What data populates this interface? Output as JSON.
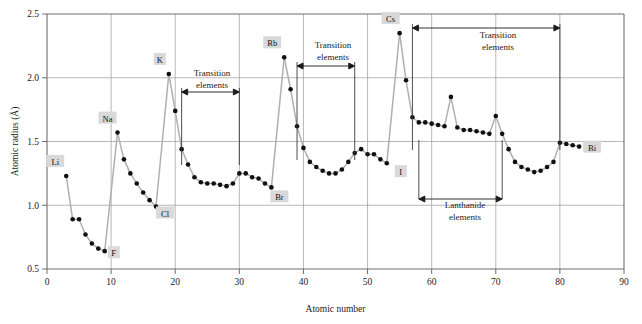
{
  "figure": {
    "background_color": "#ffffff",
    "curve_color": "#b0b0b0",
    "marker_color": "#101010",
    "grid_color": "#9a9a9a",
    "label_box_color": "#d9d9d9"
  },
  "chart_data": {
    "type": "line",
    "title": "",
    "xlabel": "Atomic number",
    "ylabel": "Atomic radius (Å)",
    "xlim": [
      0,
      90
    ],
    "ylim": [
      0.5,
      2.5
    ],
    "xticks": [
      0,
      10,
      20,
      30,
      40,
      50,
      60,
      70,
      80,
      90
    ],
    "xticklabels": [
      "0",
      "10",
      "20",
      "30",
      "40",
      "50",
      "60",
      "70",
      "80",
      "90"
    ],
    "yticks": [
      0.5,
      1.0,
      1.5,
      2.0,
      2.5
    ],
    "yticklabels": [
      "0.5",
      "1.0",
      "1.5",
      "2.0",
      "2.5"
    ],
    "grid": "major vertical every 10, major horizontal every 0.5",
    "legend": "none",
    "x": [
      3,
      4,
      5,
      6,
      7,
      8,
      9,
      11,
      12,
      13,
      14,
      15,
      16,
      17,
      19,
      20,
      21,
      22,
      23,
      24,
      25,
      26,
      27,
      28,
      29,
      30,
      31,
      32,
      33,
      34,
      35,
      37,
      38,
      39,
      40,
      41,
      42,
      43,
      44,
      45,
      46,
      47,
      48,
      49,
      50,
      51,
      52,
      53,
      55,
      56,
      57,
      58,
      59,
      60,
      61,
      62,
      63,
      64,
      65,
      66,
      67,
      68,
      69,
      70,
      71,
      72,
      73,
      74,
      75,
      76,
      77,
      78,
      79,
      80,
      81,
      82,
      83
    ],
    "y": [
      1.23,
      0.89,
      0.89,
      0.77,
      0.7,
      0.66,
      0.64,
      1.57,
      1.36,
      1.25,
      1.17,
      1.1,
      1.04,
      0.99,
      2.03,
      1.74,
      1.44,
      1.32,
      1.22,
      1.18,
      1.17,
      1.17,
      1.16,
      1.15,
      1.17,
      1.25,
      1.25,
      1.22,
      1.21,
      1.17,
      1.14,
      2.16,
      1.91,
      1.62,
      1.45,
      1.34,
      1.3,
      1.27,
      1.25,
      1.25,
      1.28,
      1.34,
      1.41,
      1.44,
      1.4,
      1.4,
      1.36,
      1.33,
      2.35,
      1.98,
      1.69,
      1.65,
      1.65,
      1.64,
      1.63,
      1.62,
      1.85,
      1.61,
      1.59,
      1.59,
      1.58,
      1.57,
      1.56,
      1.7,
      1.56,
      1.44,
      1.34,
      1.3,
      1.28,
      1.26,
      1.27,
      1.3,
      1.34,
      1.49,
      1.48,
      1.47,
      1.46
    ],
    "element_labels": [
      {
        "symbol": "Li",
        "x": 3,
        "y": 1.23
      },
      {
        "symbol": "F",
        "x": 9,
        "y": 0.64
      },
      {
        "symbol": "Na",
        "x": 11,
        "y": 1.57
      },
      {
        "symbol": "Cl",
        "x": 17,
        "y": 0.99
      },
      {
        "symbol": "K",
        "x": 19,
        "y": 2.03
      },
      {
        "symbol": "Br",
        "x": 35,
        "y": 1.14
      },
      {
        "symbol": "Rb",
        "x": 37,
        "y": 2.16
      },
      {
        "symbol": "I",
        "x": 53,
        "y": 1.33
      },
      {
        "symbol": "Cs",
        "x": 55,
        "y": 2.35
      },
      {
        "symbol": "Bi",
        "x": 83,
        "y": 1.46
      }
    ],
    "annotations": [
      {
        "text": "Transition elements",
        "x_start": 21,
        "x_end": 30,
        "line1": "Transition",
        "line2": "elements"
      },
      {
        "text": "Transition elements",
        "x_start": 39,
        "x_end": 48,
        "line1": "Transition",
        "line2": "elements"
      },
      {
        "text": "Transition elements",
        "x_start": 57,
        "x_end": 80,
        "line1": "Transition",
        "line2": "elements"
      },
      {
        "text": "Lanthanide elements",
        "x_start": 58,
        "x_end": 71,
        "line1": "Lanthanide",
        "line2": "elements"
      }
    ]
  }
}
